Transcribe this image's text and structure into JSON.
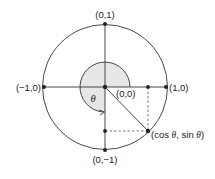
{
  "diagram": {
    "type": "unit-circle",
    "colors": {
      "stroke": "#333333",
      "shade": "#e6e6e6",
      "dot": "#222222",
      "dash": "#555555"
    },
    "labels": {
      "top": "(0,1)",
      "bottom": "(0,−1)",
      "left": "(−1,0)",
      "right": "(1,0)",
      "origin": "(0,0)",
      "angle": "θ",
      "point_prefix": "(cos ",
      "point_theta1": "θ",
      "point_mid": ", sin ",
      "point_theta2": "θ",
      "point_suffix": ")"
    }
  }
}
